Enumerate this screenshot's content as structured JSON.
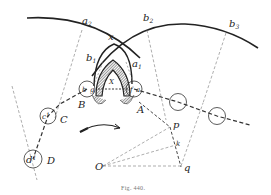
{
  "figure": {
    "caption": "Fig. 440.",
    "colors": {
      "ink": "#222222",
      "faint": "#888888",
      "hatch": "#555555",
      "background": "#ffffff"
    }
  },
  "labels": {
    "a2": {
      "base": "a",
      "sub": "2"
    },
    "b2": {
      "base": "b",
      "sub": "2"
    },
    "b3": {
      "base": "b",
      "sub": "3"
    },
    "b1": {
      "base": "b",
      "sub": "1"
    },
    "a1": {
      "base": "a",
      "sub": "1"
    },
    "x": "x",
    "X": "X",
    "B": "B",
    "A": "A",
    "C": "C",
    "D": "D",
    "c1": {
      "base": "c",
      "sub": "1"
    },
    "d1": {
      "base": "d",
      "sub": "1"
    },
    "b_small": "b",
    "g_small": "g",
    "f_small": "f",
    "a_small": "a",
    "O": "O",
    "p": "p",
    "k": "k",
    "q": "q"
  }
}
